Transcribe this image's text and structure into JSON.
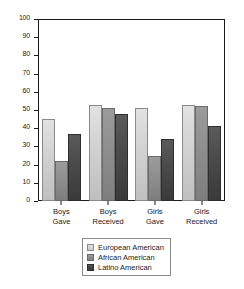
{
  "chart_data": {
    "type": "bar",
    "title": "",
    "subtitle": "",
    "xlabel": "",
    "ylabel": "",
    "ylim": [
      0,
      100
    ],
    "ytick_step": 10,
    "yticks": [
      100,
      90,
      80,
      70,
      60,
      50,
      40,
      30,
      20,
      10,
      0
    ],
    "categories": [
      "Boys Gave",
      "Boys Received",
      "Girls Gave",
      "Girls Received"
    ],
    "category_lines": [
      [
        "Boys",
        "Gave"
      ],
      [
        "Boys",
        "Received"
      ],
      [
        "Girls",
        "Gave"
      ],
      [
        "Girls",
        "Received"
      ]
    ],
    "series": [
      {
        "name": "European American",
        "values": [
          45,
          53,
          51,
          53
        ],
        "color": "#d3d3d3"
      },
      {
        "name": "African American",
        "values": [
          22,
          51,
          25,
          52
        ],
        "color": "#8e8e8e"
      },
      {
        "name": "Latino American",
        "values": [
          37,
          48,
          34,
          41
        ],
        "color": "#454545"
      }
    ],
    "grid": false,
    "legend_position": "bottom-center",
    "frame": true
  },
  "legend": {
    "entries": [
      {
        "label": "European American"
      },
      {
        "label": "African American"
      },
      {
        "label": "Latino American"
      }
    ]
  }
}
